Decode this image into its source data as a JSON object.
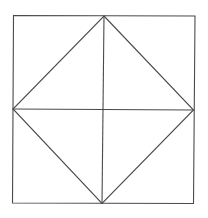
{
  "diagram": {
    "title": "",
    "stroke_color": "#4a4a4a",
    "background_color": "#ffffff",
    "shapes": [
      {
        "name": "outer-square",
        "type": "polygon",
        "vertices": [
          "top-left",
          "top-right",
          "bottom-right",
          "bottom-left"
        ]
      },
      {
        "name": "inscribed-diamond",
        "type": "polygon",
        "vertices": [
          "top-mid",
          "right-mid",
          "bottom-mid",
          "left-mid"
        ]
      },
      {
        "name": "vertical-midline",
        "type": "segment",
        "from": "top-mid",
        "to": "bottom-mid"
      },
      {
        "name": "horizontal-midline",
        "type": "segment",
        "from": "left-mid",
        "to": "right-mid"
      }
    ]
  }
}
